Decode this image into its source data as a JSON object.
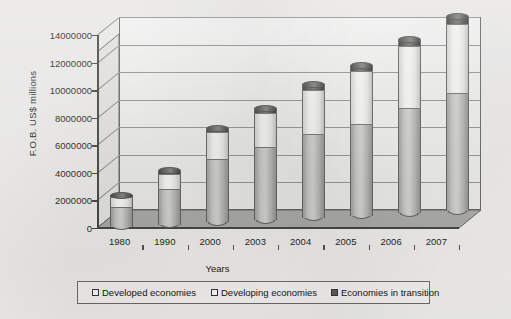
{
  "chart_data": {
    "type": "bar",
    "subtype": "stacked-column-3d-cylinder",
    "title": "",
    "xlabel": "Years",
    "ylabel": "F.O.B. US$ millions",
    "categories": [
      "1980",
      "1990",
      "2000",
      "2003",
      "2004",
      "2005",
      "2006",
      "2007"
    ],
    "series": [
      {
        "name": "Developed economies",
        "color": "#cfcfcc",
        "values": [
          1400000,
          2500000,
          4500000,
          5200000,
          6000000,
          6600000,
          7600000,
          8500000
        ]
      },
      {
        "name": "Developing economies",
        "color": "#ffffff",
        "values": [
          700000,
          1100000,
          2000000,
          2500000,
          3200000,
          3800000,
          4500000,
          5000000
        ]
      },
      {
        "name": "Economies in transition",
        "color": "#5a5a58",
        "values": [
          200000,
          300000,
          300000,
          400000,
          500000,
          500000,
          500000,
          600000
        ]
      }
    ],
    "totals": [
      2300000,
      3900000,
      6800000,
      8100000,
      9700000,
      10900000,
      12600000,
      14100000
    ],
    "ylim": [
      0,
      14000000
    ],
    "ytick_step": 2000000,
    "yticks": [
      0,
      2000000,
      4000000,
      6000000,
      8000000,
      10000000,
      12000000,
      14000000
    ],
    "ytick_labels": [
      "0",
      "2000000",
      "4000000",
      "6000000",
      "8000000",
      "10000000",
      "12000000",
      "14000000"
    ],
    "grid": true,
    "grid_axis": "y",
    "legend_position": "bottom",
    "legend": [
      "Developed economies",
      "Developing economies",
      "Economies in transition"
    ]
  },
  "axes": {
    "y_title": "F.O.B. US$ millions",
    "x_title": "Years"
  },
  "legend": {
    "items": [
      {
        "label": "Developed economies",
        "swatch": "legend-swatch-developed"
      },
      {
        "label": "Developing economies",
        "swatch": "legend-swatch-developing"
      },
      {
        "label": "Economies in transition",
        "swatch": "legend-swatch-transition"
      }
    ]
  }
}
